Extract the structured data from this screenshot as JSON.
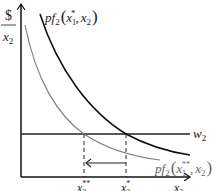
{
  "diagram": {
    "y_axis_label_top": "$",
    "y_axis_label_bottom": "x2",
    "x_axis_label": "x2",
    "wage_line_label": "w2",
    "curve_original_label": {
      "prefix": "pf",
      "sub": "2",
      "args": "(x1*, x2)"
    },
    "curve_shifted_label": {
      "prefix": "pf",
      "sub": "2",
      "args": "(x1**, x2)"
    },
    "tick_x2_double_star": "x2**",
    "tick_x2_star": "x2*",
    "colors": {
      "axes": "#111111",
      "curve_original": "#111111",
      "curve_shifted": "#808080",
      "wage_line": "#222222"
    }
  },
  "text": {
    "dollar": "$",
    "x": "x",
    "two": "2",
    "w": "w",
    "pf": "pf",
    "star": "*",
    "dstar": "**",
    "one": "1",
    "lparen": "(",
    "rparen": ")",
    "comma": ","
  }
}
